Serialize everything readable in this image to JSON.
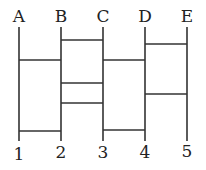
{
  "diagram": {
    "type": "ladder",
    "top_labels": [
      "A",
      "B",
      "C",
      "D",
      "E"
    ],
    "bottom_labels": [
      "1",
      "2",
      "3",
      "4",
      "5"
    ],
    "columns_x": [
      19,
      61,
      103,
      145,
      187
    ],
    "line_top_y": 27,
    "line_bottom_y": 141,
    "rungs": [
      {
        "from": 1,
        "to": 2,
        "y": 40
      },
      {
        "from": 0,
        "to": 1,
        "y": 60
      },
      {
        "from": 2,
        "to": 3,
        "y": 60
      },
      {
        "from": 3,
        "to": 4,
        "y": 44
      },
      {
        "from": 1,
        "to": 2,
        "y": 83
      },
      {
        "from": 3,
        "to": 4,
        "y": 94
      },
      {
        "from": 1,
        "to": 2,
        "y": 103
      },
      {
        "from": 2,
        "to": 3,
        "y": 130
      },
      {
        "from": 0,
        "to": 1,
        "y": 131
      }
    ],
    "line_color": "#333333"
  }
}
